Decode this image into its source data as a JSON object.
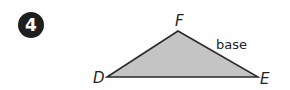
{
  "problem": {
    "number": "4"
  },
  "diagram": {
    "shape": "triangle",
    "vertices": [
      {
        "label": "D",
        "x": 107,
        "y": 77
      },
      {
        "label": "F",
        "x": 178,
        "y": 31
      },
      {
        "label": "E",
        "x": 258,
        "y": 77
      }
    ],
    "side_label": {
      "side": "FE",
      "text": "base"
    },
    "colors": {
      "fill": "#c4c4c4",
      "stroke": "#2a2a2a",
      "badge": "#1f1f1f"
    }
  }
}
